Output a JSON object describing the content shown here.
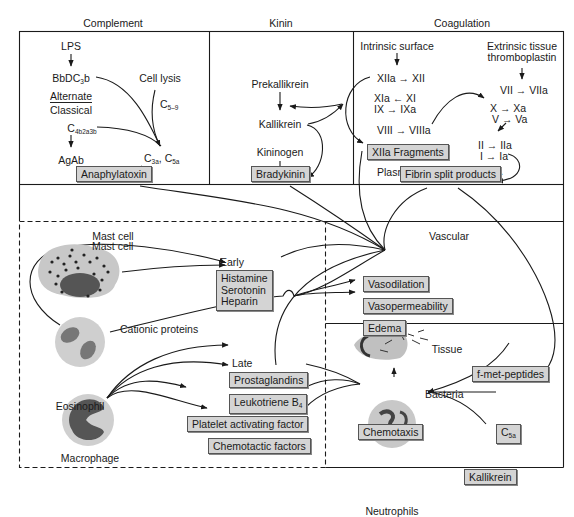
{
  "sections": {
    "complement": "Complement",
    "kinin": "Kinin",
    "coagulation": "Coagulation",
    "mast_cell": "Mast cell",
    "vascular": "Vascular",
    "tissue": "Tissue"
  },
  "complement": {
    "lps": "LPS",
    "bbdc3b": "BbDC",
    "bbdc3b_sub": "3",
    "bbdc3b_tail": "b",
    "alternate": "Alternate",
    "classical": "Classical",
    "c4b2a3b": "C",
    "c4b2a3b_sub": "4b2a3b",
    "agab": "AgAb",
    "cell_lysis": "Cell lysis",
    "c59": "C",
    "c59_sub": "5–9",
    "c3a": "C",
    "c3a_sub": "3a",
    "c5a": ", C",
    "c5a_sub": "5a",
    "anaphylatoxin": "Anaphylatoxin"
  },
  "kinin": {
    "prekallikrein": "Prekallikrein",
    "kallikrein": "Kallikrein",
    "kininogen": "Kininogen",
    "bradykinin": "Bradykinin"
  },
  "coagulation": {
    "intrinsic": "Intrinsic surface",
    "extrinsic_1": "Extrinsic tissue",
    "extrinsic_2": "thromboplastin",
    "xiia": "XIIa → XII",
    "xia": "XIa ← XI",
    "ix": "IX → IXa",
    "viii": "VIII → VIIIa",
    "vii": "VII → VIIa",
    "x": "X → Xa",
    "v": "V → Va",
    "ii": "II → IIa",
    "i": "I → Ia",
    "xiia_fragments": "XIIa Fragments",
    "plasminogen": "Plasminogen → Plasmin →",
    "fibrin": "Fibrin split products"
  },
  "mast": {
    "mast_cell_label": "Mast cell",
    "early": "Early",
    "early_items": [
      "Histamine",
      "Serotonin",
      "Heparin"
    ],
    "cationic": "Cationic proteins",
    "eosinophil": "Eosinophil",
    "late": "Late",
    "prostaglandins": "Prostaglandins",
    "leukotriene": "Leukotriene B",
    "leukotriene_sub": "4",
    "paf": "Platelet activating factor",
    "chemotactic": "Chemotactic factors",
    "macrophage": "Macrophage"
  },
  "vascular": {
    "vasodilation": "Vasodilation",
    "vasopermeability": "Vasopermeability",
    "edema": "Edema"
  },
  "tissue": {
    "bacteria": "Bacteria",
    "fmet": "f-met-peptides",
    "chemotaxis": "Chemotaxis",
    "c5a": "C",
    "c5a_sub": "5a",
    "kallikrein": "Kallikrein",
    "neutrophils": "Neutrophils"
  },
  "colors": {
    "box_fill": "#d4d4d4",
    "line": "#1a1a1a",
    "cell_gray": "#bdbdbd"
  }
}
